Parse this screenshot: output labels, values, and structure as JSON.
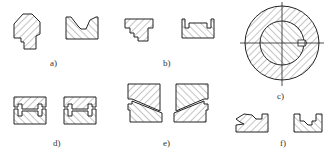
{
  "figure": {
    "panels": [
      {
        "id": "a",
        "label": "a)"
      },
      {
        "id": "b",
        "label": "b)"
      },
      {
        "id": "c",
        "label": "c)"
      },
      {
        "id": "d",
        "label": "d)"
      },
      {
        "id": "e",
        "label": "e)"
      },
      {
        "id": "f",
        "label": "f)"
      }
    ]
  }
}
